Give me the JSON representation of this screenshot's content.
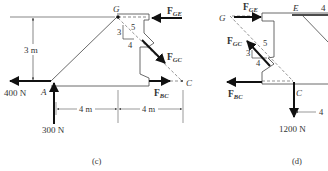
{
  "diagram_c": {
    "caption": "(c)",
    "points": {
      "A": "A",
      "G": "G",
      "C": "C"
    },
    "forces": {
      "horizontal_at_A": "400 N",
      "vertical_at_A": "300 N",
      "FGE": {
        "main": "F",
        "sub": "GE"
      },
      "FGC": {
        "main": "F",
        "sub": "GC"
      },
      "FBC": {
        "main": "F",
        "sub": "BC"
      }
    },
    "dimensions": {
      "height": "3 m",
      "span1": "4 m",
      "span2": "4 m"
    },
    "slope_triangle": {
      "rise": "3",
      "run": "4",
      "hyp": "5"
    }
  },
  "diagram_d": {
    "caption": "(d)",
    "points": {
      "G": "G",
      "E": "E",
      "C": "C"
    },
    "forces": {
      "FGE": {
        "main": "F",
        "sub": "GE"
      },
      "FGC": {
        "main": "F",
        "sub": "GC"
      },
      "FBC": {
        "main": "F",
        "sub": "BC"
      },
      "load_at_C": "1200 N",
      "cropped_top_right": "4"
    },
    "dimensions": {
      "span": "4"
    },
    "slope_triangle": {
      "rise": "3",
      "run": "4",
      "hyp": "5"
    }
  }
}
